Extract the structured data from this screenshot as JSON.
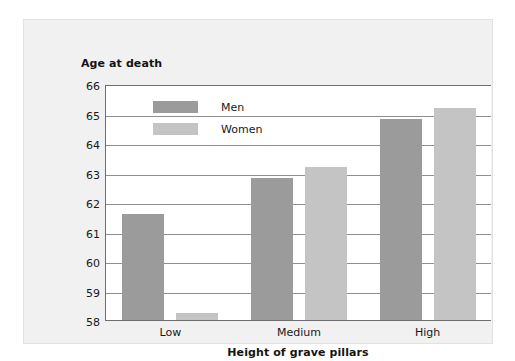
{
  "chart_data": {
    "type": "bar",
    "title": "",
    "subtitle": "",
    "ylabel": "Age at death",
    "xlabel": "Height of grave pillars",
    "categories": [
      "Low",
      "Medium",
      "High"
    ],
    "series": [
      {
        "name": "Men",
        "color": "#9b9b9b",
        "values": [
          61.6,
          62.8,
          64.8
        ]
      },
      {
        "name": "Women",
        "color": "#c4c4c4",
        "values": [
          58.25,
          63.2,
          65.2
        ]
      }
    ],
    "ylim": [
      58,
      66
    ],
    "ytick_labels": [
      "66",
      "65",
      "64",
      "63",
      "62",
      "61",
      "60",
      "59",
      "58"
    ],
    "ytick_values": [
      66,
      65,
      64,
      63,
      62,
      61,
      60,
      59,
      58
    ],
    "grid": "horizontal",
    "legend_position": "inside-top-left",
    "background_color": "#f1f1f1",
    "plot_background_color": "#ffffff",
    "axis_color": "#6e6e6e",
    "gridline_color": "#8f8f8f"
  }
}
